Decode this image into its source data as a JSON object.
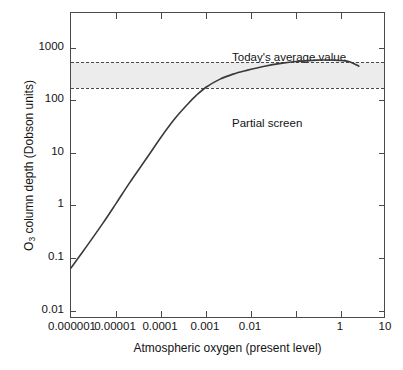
{
  "figure": {
    "background_color": "#ffffff",
    "axis_color": "#4a4a4a",
    "band_color": "#ececec",
    "curve_color": "#3a3a3a"
  },
  "axes": {
    "x_title": "Atmospheric oxygen (present level)",
    "y_title_main": "O",
    "y_title_sub": "3",
    "y_title_rest": " column depth (Dobson units)",
    "x_tick_labels": [
      "0.000001",
      "0.00001",
      "0.0001",
      "0.001",
      "0.01",
      "",
      "1",
      "10"
    ],
    "y_tick_labels": [
      "1000",
      "100",
      "10",
      "1",
      "0.1",
      "0.01"
    ]
  },
  "annotations": {
    "today": "Today's average value",
    "partial": "Partial screen"
  },
  "chart_data": {
    "type": "line",
    "title": "",
    "xlabel": "Atmospheric oxygen (present level)",
    "ylabel": "O3 column depth (Dobson units)",
    "xscale": "log",
    "yscale": "log",
    "xlim": [
      1e-06,
      10
    ],
    "ylim": [
      0.003,
      3000
    ],
    "grid": false,
    "legend": null,
    "x_ticks": [
      1e-06,
      1e-05,
      0.0001,
      0.001,
      0.01,
      0.1,
      1,
      10
    ],
    "x_tick_labels": [
      "0.000001",
      "0.00001",
      "0.0001",
      "0.001",
      "0.01",
      "",
      "1",
      "10"
    ],
    "y_ticks": [
      1000,
      100,
      10,
      1,
      0.1,
      0.01
    ],
    "y_tick_labels": [
      "1000",
      "100",
      "10",
      "1",
      "0.1",
      "0.01"
    ],
    "series": [
      {
        "name": "O3 column depth",
        "x": [
          1e-06,
          2e-06,
          5e-06,
          1e-05,
          2e-05,
          5e-05,
          0.0001,
          0.0002,
          0.0004,
          0.0006,
          0.001,
          0.002,
          0.004,
          0.008,
          0.02,
          0.05,
          0.1,
          0.3,
          0.7,
          1.0,
          1.6,
          2.5
        ],
        "y": [
          0.03,
          0.07,
          0.22,
          0.55,
          1.4,
          4.5,
          11,
          25,
          50,
          72,
          105,
          150,
          190,
          225,
          272,
          312,
          335,
          358,
          358,
          352,
          330,
          272
        ]
      }
    ],
    "bands": [
      {
        "name": "Partial screen",
        "y_min": 100,
        "y_max": 330,
        "fill": "#ececec",
        "edge_style": "dashed"
      }
    ],
    "annotations": [
      {
        "text": "Today's average value",
        "x": 0.02,
        "y": 500
      },
      {
        "text": "Partial screen",
        "x": 0.02,
        "y": 60
      }
    ]
  }
}
